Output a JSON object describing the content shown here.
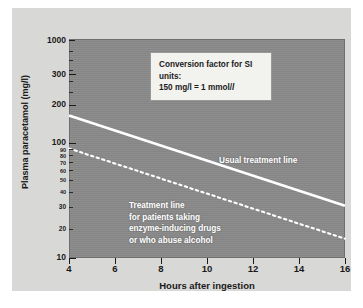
{
  "chart_data": {
    "type": "line",
    "title": "",
    "xlabel": "Hours after ingestion",
    "ylabel": "Plasma paracetamol (mg/l)",
    "xlim": [
      4,
      16
    ],
    "ylim": [
      10,
      1000
    ],
    "yscale": "log",
    "grid": false,
    "legend_position": "inline-annotations",
    "xticks": [
      4,
      6,
      8,
      10,
      12,
      14,
      16
    ],
    "xticklabels": [
      "4",
      "6",
      "8",
      "10",
      "12",
      "14",
      "16"
    ],
    "yticks_major": [
      1000,
      300,
      200,
      100,
      90,
      80,
      70,
      60,
      50,
      40,
      30,
      20,
      10
    ],
    "yticklabels": [
      "1000",
      "300",
      "200",
      "100",
      "90",
      "80",
      "70",
      "60",
      "50",
      "40",
      "30",
      "20",
      "10"
    ],
    "series": [
      {
        "name": "Usual treatment line",
        "style": "solid",
        "color": "#ffffff",
        "x": [
          4,
          16
        ],
        "y": [
          200,
          30
        ]
      },
      {
        "name": "Treatment line for patients taking enzyme-inducing drugs or who abuse alcohol",
        "style": "dotted",
        "color": "#ffffff",
        "x": [
          4,
          16
        ],
        "y": [
          100,
          15
        ]
      }
    ],
    "annotations": [
      {
        "name": "conversion-note",
        "lines": [
          "Conversion factor for SI units:",
          "150 mg/l = 1 mmol/l"
        ]
      },
      {
        "name": "usual-treatment-line-label",
        "text": "Usual treatment line"
      },
      {
        "name": "enzyme-treatment-line-label",
        "lines": [
          "Treatment line",
          "for patients taking",
          "enzyme-inducing drugs",
          "or who abuse alcohol"
        ]
      }
    ],
    "colors": {
      "plot_background": "#8a8a8a",
      "panel_background": "#d8d8d6",
      "line": "#ffffff",
      "axis": "#1a1a1a",
      "infobox_background": "#f2f2ef"
    }
  },
  "axes": {
    "x_title": "Hours after ingestion",
    "y_title": "Plasma paracetamol (mg/l)",
    "x_labels": [
      "4",
      "6",
      "8",
      "10",
      "12",
      "14",
      "16"
    ],
    "y_labels_major": [
      "1000",
      "300",
      "200",
      "100",
      "10"
    ],
    "y_labels_minor": [
      "90",
      "80",
      "70",
      "60",
      "50",
      "40",
      "30",
      "20"
    ]
  },
  "infobox": {
    "line1": "Conversion factor for SI units:",
    "line2_prefix": "150 mg/l = 1 mmol/",
    "line2_italic": "l"
  },
  "labels": {
    "usual": "Usual treatment line",
    "enzyme_1": "Treatment line",
    "enzyme_2": "for patients taking",
    "enzyme_3": "enzyme-inducing drugs",
    "enzyme_4": "or who abuse alcohol"
  }
}
